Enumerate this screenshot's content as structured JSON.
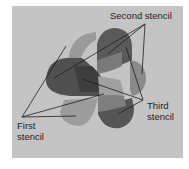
{
  "diagram": {
    "labels": {
      "second": "Second stencil",
      "third_line1": "Third",
      "third_line2": "stencil",
      "first_line1": "First",
      "first_line2": "stencil"
    },
    "colors": {
      "background": "#c4c4c4",
      "page": "#ffffff",
      "dark": "#4a4a4a",
      "medium": "#6e6e6e",
      "light": "#8f8f8f",
      "lines": "#1e1e1e"
    },
    "shapes": [
      {
        "id": "top-left-lobe",
        "tone": "light"
      },
      {
        "id": "top-right-lobe",
        "tone": "dark"
      },
      {
        "id": "left-lobe",
        "tone": "dark"
      },
      {
        "id": "right-lobe",
        "tone": "light"
      },
      {
        "id": "bottom-left-lobe",
        "tone": "light"
      },
      {
        "id": "bottom-right-lobe",
        "tone": "dark"
      },
      {
        "id": "center-band",
        "tone": "medium"
      }
    ]
  }
}
